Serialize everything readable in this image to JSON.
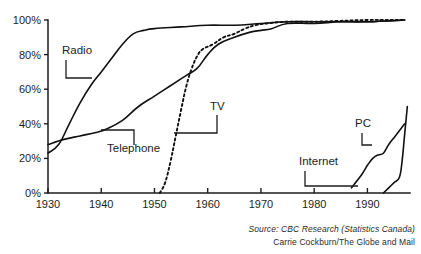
{
  "chart_data": {
    "type": "line",
    "title": "",
    "xlabel": "",
    "ylabel": "",
    "xlim": [
      1930,
      1998
    ],
    "ylim": [
      0,
      100
    ],
    "grid": false,
    "legend_position": "inline-annotations",
    "x_ticks": [
      "1930",
      "1940",
      "1950",
      "1960",
      "1970",
      "1980",
      "1990"
    ],
    "x_tick_values": [
      1930,
      1940,
      1950,
      1960,
      1970,
      1980,
      1990
    ],
    "y_ticks": [
      "0%",
      "20%",
      "40%",
      "60%",
      "80%",
      "100%"
    ],
    "y_tick_values": [
      0,
      20,
      40,
      60,
      80,
      100
    ],
    "series": [
      {
        "name": "Radio",
        "style": "solid",
        "points": [
          [
            1930,
            23
          ],
          [
            1932,
            28
          ],
          [
            1934,
            40
          ],
          [
            1936,
            52
          ],
          [
            1938,
            62
          ],
          [
            1940,
            70
          ],
          [
            1942,
            78
          ],
          [
            1944,
            86
          ],
          [
            1946,
            92
          ],
          [
            1948,
            94
          ],
          [
            1950,
            95
          ],
          [
            1955,
            96
          ],
          [
            1960,
            97
          ],
          [
            1965,
            97
          ],
          [
            1970,
            98
          ],
          [
            1975,
            99
          ],
          [
            1980,
            99
          ],
          [
            1985,
            99
          ],
          [
            1990,
            99
          ],
          [
            1997,
            100
          ]
        ]
      },
      {
        "name": "Telephone",
        "style": "solid",
        "points": [
          [
            1930,
            28
          ],
          [
            1933,
            31
          ],
          [
            1936,
            33
          ],
          [
            1939,
            35
          ],
          [
            1941,
            37
          ],
          [
            1944,
            42
          ],
          [
            1947,
            50
          ],
          [
            1950,
            56
          ],
          [
            1953,
            62
          ],
          [
            1956,
            68
          ],
          [
            1958,
            72
          ],
          [
            1960,
            80
          ],
          [
            1962,
            86
          ],
          [
            1965,
            90
          ],
          [
            1968,
            93
          ],
          [
            1970,
            94
          ],
          [
            1972,
            95
          ],
          [
            1975,
            98
          ],
          [
            1980,
            98
          ],
          [
            1985,
            99
          ],
          [
            1990,
            99
          ],
          [
            1997,
            100
          ]
        ]
      },
      {
        "name": "TV",
        "style": "dotted",
        "points": [
          [
            1951,
            0
          ],
          [
            1952,
            6
          ],
          [
            1953,
            18
          ],
          [
            1954,
            33
          ],
          [
            1955,
            48
          ],
          [
            1956,
            62
          ],
          [
            1957,
            72
          ],
          [
            1958,
            79
          ],
          [
            1959,
            83
          ],
          [
            1961,
            86
          ],
          [
            1963,
            90
          ],
          [
            1965,
            92
          ],
          [
            1967,
            95
          ],
          [
            1969,
            97
          ],
          [
            1971,
            98
          ],
          [
            1975,
            99
          ],
          [
            1980,
            99
          ],
          [
            1990,
            100
          ],
          [
            1997,
            100
          ]
        ]
      },
      {
        "name": "PC",
        "style": "solid",
        "points": [
          [
            1987,
            3
          ],
          [
            1989,
            11
          ],
          [
            1990,
            16
          ],
          [
            1991,
            20
          ],
          [
            1992,
            22
          ],
          [
            1993,
            23
          ],
          [
            1994,
            28
          ],
          [
            1995,
            32
          ],
          [
            1996,
            36
          ],
          [
            1997,
            40
          ]
        ]
      },
      {
        "name": "Internet",
        "style": "solid",
        "points": [
          [
            1993,
            0
          ],
          [
            1994,
            3
          ],
          [
            1995,
            6
          ],
          [
            1996,
            9
          ],
          [
            1996.5,
            18
          ],
          [
            1997,
            34
          ],
          [
            1997.5,
            50
          ]
        ]
      }
    ],
    "annotations": [
      {
        "label": "Radio",
        "label_x": 62,
        "label_y": 54
      },
      {
        "label": "Telephone",
        "label_x": 107,
        "label_y": 152
      },
      {
        "label": "TV",
        "label_x": 210,
        "label_y": 110
      },
      {
        "label": "PC",
        "label_x": 355,
        "label_y": 127
      },
      {
        "label": "Internet",
        "label_x": 299,
        "label_y": 165
      }
    ]
  },
  "credit": {
    "source": "Source: CBC Research (Statistics Canada)",
    "byline": "Carrie Cockburn/The Globe and Mail"
  }
}
